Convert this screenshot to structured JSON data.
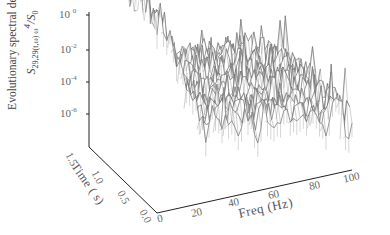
{
  "chart_data": {
    "type": "surface-3d",
    "title": "",
    "zlabel_line1": "Evolutionary spectral density",
    "zlabel_line2_main": "S",
    "zlabel_line2_sub": "29,29",
    "zlabel_line2_args": "(t,ω) ω",
    "zlabel_line2_pow": "4",
    "zlabel_line2_tail": "/S",
    "zlabel_line2_tailsub": "0",
    "zscale": "log",
    "zticks": [
      {
        "base": "10",
        "exp": "0"
      },
      {
        "base": "10",
        "exp": "-2"
      },
      {
        "base": "10",
        "exp": "-4"
      },
      {
        "base": "10",
        "exp": "-6"
      }
    ],
    "xlabel": "Freq (Hz)",
    "xticks": [
      "0",
      "20",
      "40",
      "60",
      "80",
      "100"
    ],
    "xlim": [
      0,
      100
    ],
    "ylabel": "Time ( s)",
    "yticks": [
      "0.0",
      "0.5",
      "1.0",
      "1.5"
    ],
    "ylim": [
      0,
      1.5
    ],
    "approx_profile_vs_freq": {
      "freq_hz": [
        0,
        5,
        10,
        15,
        20,
        30,
        40,
        60,
        80,
        100
      ],
      "log10_density": [
        -0.3,
        -0.8,
        -1.8,
        -2.8,
        -3.6,
        -4.0,
        -4.1,
        -4.2,
        -4.4,
        -4.8
      ]
    },
    "grid": false,
    "legend": null
  }
}
